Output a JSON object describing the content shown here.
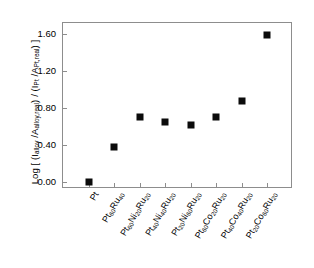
{
  "chart_data": {
    "type": "scatter",
    "title": "",
    "xlabel": "",
    "ylabel": "Log [ (Ialloy /Aalloy,real) / (IPt /APt,real) ]",
    "ylabel_parts": {
      "prefix": "Log [ (I",
      "sub1": "alloy",
      "mid1": " /A",
      "sub2": "alloy,real",
      "mid2": ") / (I",
      "sub3": "Pt",
      "mid3": " /A",
      "sub4": "Pt,real",
      "suffix": ") ]"
    },
    "categories": [
      "Pt",
      "Pt60Ru40",
      "Pt60Ni20Ru20",
      "Pt40Ni40Ru20",
      "Pt20Ni60Ru20",
      "Pt60Co20Ru20",
      "Pt40Co40Ru20",
      "Pt20Co60Ru20"
    ],
    "category_labels": [
      {
        "base": "Pt",
        "parts": []
      },
      {
        "base": "Pt",
        "parts": [
          {
            "sub": "60"
          },
          {
            "txt": "Ru"
          },
          {
            "sub": "40"
          }
        ]
      },
      {
        "base": "Pt",
        "parts": [
          {
            "sub": "60"
          },
          {
            "txt": "Ni"
          },
          {
            "sub": "20"
          },
          {
            "txt": "Ru"
          },
          {
            "sub": "20"
          }
        ]
      },
      {
        "base": "Pt",
        "parts": [
          {
            "sub": "40"
          },
          {
            "txt": "Ni"
          },
          {
            "sub": "40"
          },
          {
            "txt": "Ru"
          },
          {
            "sub": "20"
          }
        ]
      },
      {
        "base": "Pt",
        "parts": [
          {
            "sub": "20"
          },
          {
            "txt": "Ni"
          },
          {
            "sub": "60"
          },
          {
            "txt": "Ru"
          },
          {
            "sub": "20"
          }
        ]
      },
      {
        "base": "Pt",
        "parts": [
          {
            "sub": "60"
          },
          {
            "txt": "Co"
          },
          {
            "sub": "20"
          },
          {
            "txt": "Ru"
          },
          {
            "sub": "20"
          }
        ]
      },
      {
        "base": "Pt",
        "parts": [
          {
            "sub": "40"
          },
          {
            "txt": "Co"
          },
          {
            "sub": "40"
          },
          {
            "txt": "Ru"
          },
          {
            "sub": "20"
          }
        ]
      },
      {
        "base": "Pt",
        "parts": [
          {
            "sub": "20"
          },
          {
            "txt": "Co"
          },
          {
            "sub": "60"
          },
          {
            "txt": "Ru"
          },
          {
            "sub": "20"
          }
        ]
      }
    ],
    "values": [
      0.0,
      0.38,
      0.7,
      0.65,
      0.61,
      0.7,
      0.87,
      1.59
    ],
    "ytick_labels": [
      "0.00",
      "0.40",
      "0.80",
      "1.20",
      "1.60"
    ],
    "ytick_values": [
      0.0,
      0.4,
      0.8,
      1.2,
      1.6
    ],
    "ylim": [
      -0.08,
      1.72
    ],
    "xlim": [
      0,
      9
    ],
    "grid": false,
    "legend": false,
    "marker": {
      "shape": "square",
      "color": "#0b0b0b",
      "size": 7
    },
    "axis_color": "#8d8d8d",
    "background": "#ffffff"
  }
}
